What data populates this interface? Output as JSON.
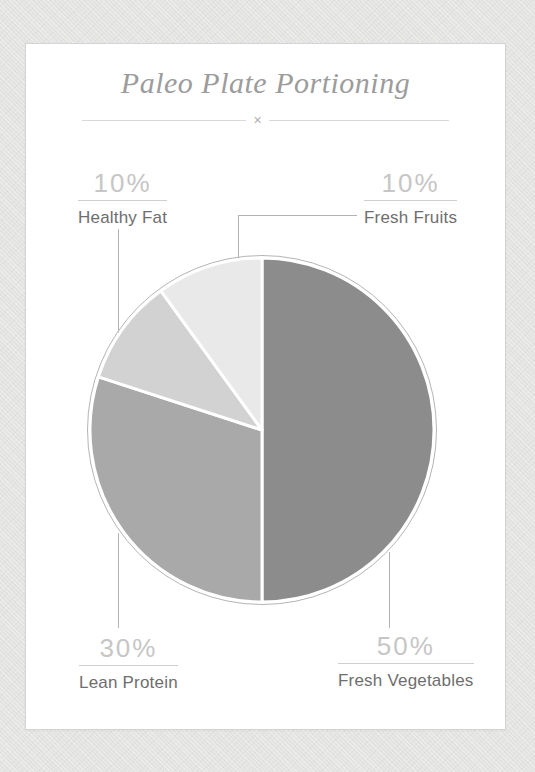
{
  "header": {
    "title": "Paleo Plate Portioning",
    "divider_symbol": "×"
  },
  "chart_data": {
    "type": "pie",
    "title": "Paleo Plate Portioning",
    "start_angle_deg": 0,
    "direction": "clockwise",
    "categories": [
      "Fresh Vegetables",
      "Lean Protein",
      "Healthy Fat",
      "Fresh Fruits"
    ],
    "values": [
      50,
      30,
      10,
      10
    ],
    "slices": [
      {
        "label": "Fresh Vegetables",
        "pct_label": "50%",
        "value": 50,
        "color": "#8c8c8c",
        "callout_position": "bottom-right"
      },
      {
        "label": "Lean Protein",
        "pct_label": "30%",
        "value": 30,
        "color": "#a9a9a9",
        "callout_position": "bottom-left"
      },
      {
        "label": "Healthy Fat",
        "pct_label": "10%",
        "value": 10,
        "color": "#d2d2d2",
        "callout_position": "top-left"
      },
      {
        "label": "Fresh Fruits",
        "pct_label": "10%",
        "value": 10,
        "color": "#e9e9e9",
        "callout_position": "top-right"
      }
    ],
    "separator_color": "#ffffff",
    "ring_color": "#b5b5b5",
    "legend_position": "callout-labels"
  },
  "colors": {
    "page_background": "#e4e4e2",
    "card_background": "#ffffff",
    "card_border": "#d4d4d4",
    "title_text": "#9c9c9c",
    "percent_text": "#c6c6c6",
    "label_text": "#6e6e6e",
    "connector_line": "#b3b3b3"
  }
}
